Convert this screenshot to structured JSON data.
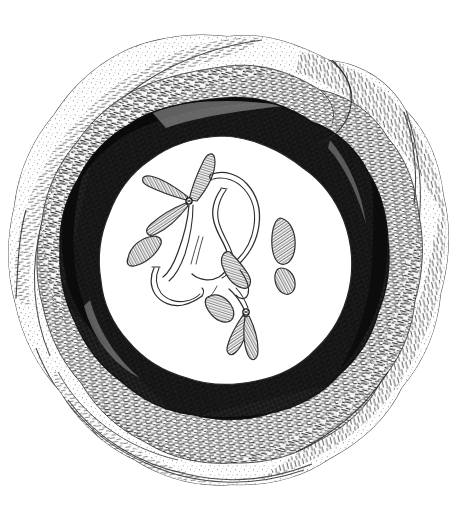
{
  "figure": {
    "title": "Cell nucleus with chromosomes — pen and ink illustration",
    "medium": "pen-and-ink stipple and crosshatch drawing",
    "background_color": "#ffffff",
    "ink_color": "#1a1a1a",
    "canvas": {
      "width": 457,
      "height": 521
    },
    "caption": "",
    "labels": []
  },
  "structure": {
    "outer_envelope": {
      "name": "outer cytoplasmic sheath",
      "description": "irregular lobed wavy outer boundary, lightly stippled",
      "center": {
        "x": 228,
        "y": 262
      },
      "radius_x": 215,
      "radius_y": 228,
      "fill": "#ffffff",
      "stroke": "#3a3a3a",
      "texture": "fine stipple with sparse short strokes"
    },
    "middle_band": {
      "name": "middle membrane band",
      "description": "second concentric wavy band, medium grey crosshatch",
      "radius_x": 180,
      "radius_y": 190,
      "tone": "#8a8a8a",
      "texture": "dense short dashes following band curvature"
    },
    "dark_ring": {
      "name": "nuclear envelope dark ring",
      "description": "heavy near-black crosshatched ring encircling nucleoplasm",
      "radius_x": 138,
      "radius_y": 140,
      "thickness": 26,
      "tone": "#141414",
      "texture": "heavy crosshatch, near solid black in upper-left and right arcs"
    },
    "nucleoplasm": {
      "name": "nucleoplasm",
      "description": "clear white interior circle holding the chromosomes",
      "center": {
        "x": 222,
        "y": 253
      },
      "radius_x": 118,
      "radius_y": 117,
      "fill": "#ffffff",
      "stroke": "#2b2b2b"
    }
  },
  "chromosomes": [
    {
      "id": "chr-1",
      "label": "upper cluster, three-armed with centromere knot",
      "centromere": {
        "x": 189,
        "y": 200
      },
      "arms": 4,
      "shading": "parallel line hatch"
    },
    {
      "id": "chr-2",
      "label": "upper-left hatched arm pointing up-right",
      "centromere": {
        "x": 189,
        "y": 200
      },
      "arms": 1,
      "shading": "parallel line hatch"
    },
    {
      "id": "chr-3",
      "label": "left free hatched body",
      "centromere": {
        "x": 140,
        "y": 256
      },
      "arms": 1,
      "shading": "parallel line hatch"
    },
    {
      "id": "chr-4",
      "label": "left slender outline thread",
      "centromere": {
        "x": 152,
        "y": 282
      },
      "arms": 1,
      "shading": "outline only"
    },
    {
      "id": "chr-5",
      "label": "central long sinuous thread",
      "centromere": {
        "x": 216,
        "y": 215
      },
      "arms": 1,
      "shading": "outline only"
    },
    {
      "id": "chr-6",
      "label": "central right long curved thread",
      "centromere": {
        "x": 243,
        "y": 200
      },
      "arms": 1,
      "shading": "outline only"
    },
    {
      "id": "chr-7",
      "label": "mid hooked hatched body",
      "centromere": {
        "x": 240,
        "y": 268
      },
      "arms": 1,
      "shading": "parallel line hatch"
    },
    {
      "id": "chr-8",
      "label": "right upper hatched leaf body",
      "centromere": {
        "x": 285,
        "y": 236
      },
      "arms": 1,
      "shading": "parallel line hatch"
    },
    {
      "id": "chr-9",
      "label": "right lower small hatched fragment",
      "centromere": {
        "x": 290,
        "y": 276
      },
      "arms": 1,
      "shading": "parallel line hatch"
    },
    {
      "id": "chr-10",
      "label": "lower-left hatched body above knot",
      "centromere": {
        "x": 218,
        "y": 300
      },
      "arms": 1,
      "shading": "parallel line hatch"
    },
    {
      "id": "chr-11",
      "label": "lower three-armed chromosome with centromere knot",
      "centromere": {
        "x": 245,
        "y": 312
      },
      "arms": 3,
      "shading": "parallel line hatch"
    }
  ]
}
